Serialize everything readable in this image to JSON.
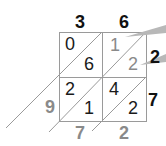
{
  "diagram": {
    "type": "lattice-multiplication",
    "colors": {
      "grid": "#9a9a9a",
      "text_dark": "#1a1a1a",
      "text_gray": "#8a8a8a",
      "callout": "#b8b8b8"
    },
    "top_digits": [
      "3",
      "6"
    ],
    "right_digits": [
      "2",
      "7"
    ],
    "cells": [
      {
        "row": 0,
        "col": 0,
        "tens": "0",
        "ones": "6",
        "gray": false
      },
      {
        "row": 0,
        "col": 1,
        "tens": "1",
        "ones": "2",
        "gray": true
      },
      {
        "row": 1,
        "col": 0,
        "tens": "2",
        "ones": "1",
        "gray": false
      },
      {
        "row": 1,
        "col": 1,
        "tens": "4",
        "ones": "2",
        "gray": false
      }
    ],
    "result_left": [
      "9"
    ],
    "result_bottom": [
      "7",
      "2"
    ],
    "result": "972"
  }
}
